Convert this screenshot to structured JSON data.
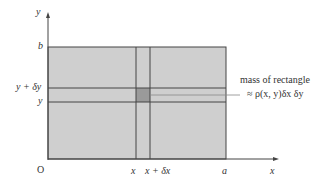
{
  "diagram": {
    "axes": {
      "x_label": "x",
      "y_label": "y",
      "origin_label": "O"
    },
    "x_ticks": [
      "x",
      "x + δx",
      "a"
    ],
    "y_ticks": [
      "b",
      "y + δy",
      "y"
    ],
    "annotation": {
      "line1": "mass of rectangle",
      "line2": "≈ ρ(x, y)δx δy"
    },
    "colors": {
      "region_fill": "#cfcfcf",
      "small_rect_fill": "#9a9a9a",
      "lines": "#444444"
    }
  }
}
